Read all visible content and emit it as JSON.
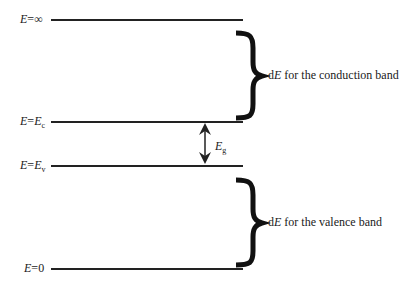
{
  "levels": [
    {
      "id": "infinity",
      "prefix": "E",
      "eq": "=",
      "value": "∞",
      "sub": ""
    },
    {
      "id": "conduction",
      "prefix": "E",
      "eq": "=",
      "value": "E",
      "sub": "c"
    },
    {
      "id": "valence",
      "prefix": "E",
      "eq": "=",
      "value": "E",
      "sub": "v"
    },
    {
      "id": "zero",
      "prefix": "E",
      "eq": "=",
      "value": "0",
      "sub": ""
    }
  ],
  "gap": {
    "symbol": "E",
    "sub": "g"
  },
  "annotations": {
    "conduction": {
      "d": "d",
      "E": "E",
      "rest": " for the conduction band"
    },
    "valence": {
      "d": "d",
      "E": "E",
      "rest": " for the valence band"
    }
  }
}
